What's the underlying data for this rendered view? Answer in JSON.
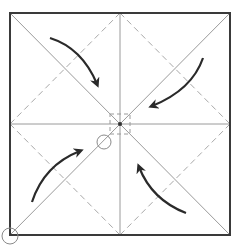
{
  "diagram": {
    "type": "origami-fold-diagram",
    "colors": {
      "background": "#ffffff",
      "outline": "#3a3a3a",
      "crease": "#9a9a9a",
      "dashed": "#a8a8a8",
      "arrow": "#2a2a2a",
      "marker": "#8a8a8a"
    },
    "square": {
      "x1": 10,
      "y1": 13,
      "x2": 230,
      "y2": 235
    },
    "center": {
      "x": 120,
      "y": 124
    },
    "arrows": [
      {
        "name": "arrow-top-left",
        "from": "top-left",
        "direction": "toward-center"
      },
      {
        "name": "arrow-top-right",
        "from": "top-right",
        "direction": "toward-center"
      },
      {
        "name": "arrow-bottom-left",
        "from": "bottom-left",
        "direction": "toward-center"
      },
      {
        "name": "arrow-bottom-right",
        "from": "bottom-right",
        "direction": "toward-center"
      }
    ],
    "markers": [
      {
        "name": "circle-marker-inner",
        "cx": 104,
        "cy": 142,
        "r": 7
      },
      {
        "name": "circle-marker-corner",
        "cx": 10,
        "cy": 236,
        "r": 8
      }
    ]
  }
}
